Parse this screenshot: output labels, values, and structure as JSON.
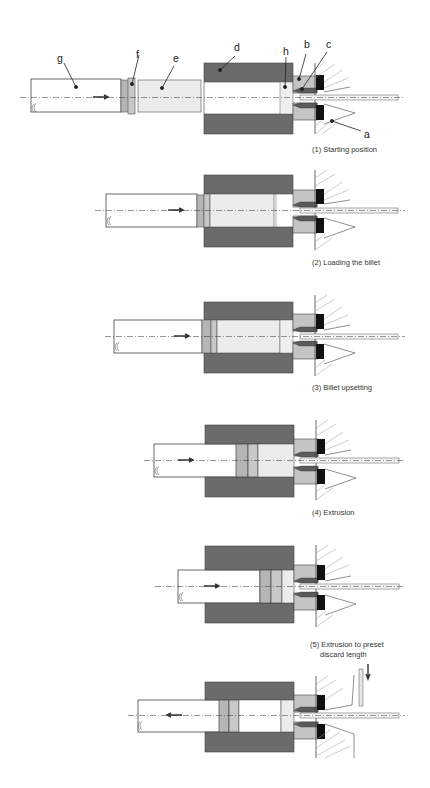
{
  "diagram": {
    "type": "process-sequence",
    "labels": {
      "a": "a",
      "b": "b",
      "c": "c",
      "d": "d",
      "e": "e",
      "f": "f",
      "g": "g",
      "h": "h"
    },
    "steps": [
      {
        "caption": "(1) Starting position"
      },
      {
        "caption": "(2) Loading the billet"
      },
      {
        "caption": "(3) Billet upsetting"
      },
      {
        "caption": "(4) Extrusion"
      },
      {
        "caption_line1": "(5) Extrusion to preset",
        "caption_line2": "discard length"
      },
      {
        "caption": ""
      }
    ],
    "colors": {
      "container": "#6b6b6b",
      "billet": "#ececec",
      "dummy_block": "#b5b5b5",
      "die_holder": "#c4c4c4",
      "die": "#111111",
      "stem": "#ffffff",
      "outline": "#333333"
    }
  }
}
